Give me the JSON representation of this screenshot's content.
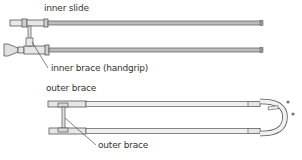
{
  "diagram": {
    "labels": {
      "inner_slide": "inner slide",
      "inner_brace": "inner brace (handgrip)",
      "outer_brace_top": "outer brace",
      "outer_brace_pointer": "outer brace"
    },
    "colors": {
      "tube_fill": "#bdbdbd",
      "tube_stroke": "#555555",
      "leader_line": "#333333",
      "text": "#333333"
    }
  }
}
